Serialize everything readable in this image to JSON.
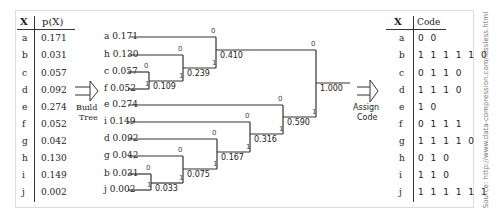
{
  "left_table": {
    "header_x": "X",
    "header_p": "p(X)",
    "rows": [
      {
        "x": "a",
        "p": "0.171"
      },
      {
        "x": "b",
        "p": "0.031"
      },
      {
        "x": "c",
        "p": "0.057"
      },
      {
        "x": "d",
        "p": "0.092"
      },
      {
        "x": "e",
        "p": "0.274"
      },
      {
        "x": "f",
        "p": "0.052"
      },
      {
        "x": "g",
        "p": "0.042"
      },
      {
        "x": "h",
        "p": "0.130"
      },
      {
        "x": "i",
        "p": "0.149"
      },
      {
        "x": "j",
        "p": "0.002"
      }
    ]
  },
  "arrow_build": {
    "line1": "Build",
    "line2": "Tree"
  },
  "tree": {
    "leaves": [
      {
        "label": "a 0.171"
      },
      {
        "label": "h 0.130"
      },
      {
        "label": "c 0.057"
      },
      {
        "label": "f 0.052"
      },
      {
        "label": "e 0.274"
      },
      {
        "label": "i 0.149"
      },
      {
        "label": "d 0.092"
      },
      {
        "label": "g 0.042"
      },
      {
        "label": "b 0.031"
      },
      {
        "label": "j 0.002"
      }
    ],
    "nodes": {
      "n109": "0.109",
      "n239": "0.239",
      "n410": "0.410",
      "n033": "0.033",
      "n075": "0.075",
      "n167": "0.167",
      "n316": "0.316",
      "n590": "0.590",
      "root": "1.000"
    },
    "bit0": "0",
    "bit1": "1"
  },
  "arrow_assign": {
    "line1": "Assign",
    "line2": "Code"
  },
  "right_table": {
    "header_x": "X",
    "header_code": "Code",
    "rows": [
      {
        "x": "a",
        "code": "0 0"
      },
      {
        "x": "b",
        "code": "1 1 1 1 1 0"
      },
      {
        "x": "c",
        "code": "0 1 1 0"
      },
      {
        "x": "d",
        "code": "1 1 1 0"
      },
      {
        "x": "e",
        "code": "1 0"
      },
      {
        "x": "f",
        "code": "0 1 1 1"
      },
      {
        "x": "g",
        "code": "1 1 1 1 0"
      },
      {
        "x": "h",
        "code": "0 1 0"
      },
      {
        "x": "i",
        "code": "1 1 0"
      },
      {
        "x": "j",
        "code": "1 1 1 1 1 1"
      }
    ]
  },
  "source": "Source: http://www.data-compression.com/lossless.html"
}
